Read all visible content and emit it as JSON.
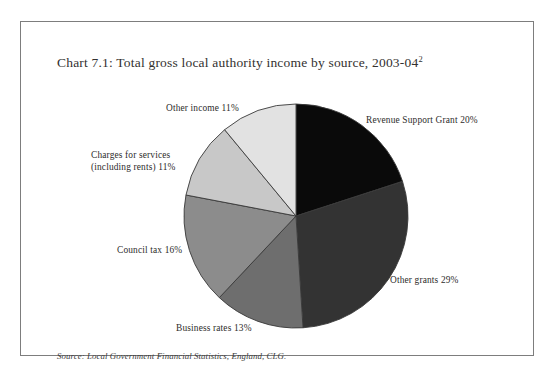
{
  "figure": {
    "title": "Chart 7.1: Total gross local authority income by source, 2003-04",
    "title_superscript": "2",
    "source_note": "Source: Local Government Financial Statistics, England, CLG."
  },
  "labels": {
    "revenue_support_grant": "Revenue Support Grant  20%",
    "other_grants": "Other grants  29%",
    "business_rates": "Business rates  13%",
    "council_tax": "Council tax  16%",
    "charges_for_services_line1": "Charges for services",
    "charges_for_services_line2": "(including rents)  11%",
    "other_income": "Other income  11%"
  },
  "chart_data": {
    "type": "pie",
    "title": "Chart 7.1: Total gross local authority income by source, 2003-04",
    "unit": "percent",
    "start_angle_deg": 0,
    "direction": "clockwise",
    "total": 100,
    "categories": [
      "Revenue Support Grant",
      "Other grants",
      "Business rates",
      "Council tax",
      "Charges for services (including rents)",
      "Other income"
    ],
    "values": [
      20,
      29,
      13,
      16,
      11,
      11
    ],
    "slice_colors": [
      "#0a0a0a",
      "#333333",
      "#6e6e6e",
      "#8c8c8c",
      "#c8c8c8",
      "#e2e2e2"
    ],
    "slice_outline_color": "#3a3a3a",
    "legend": "none",
    "data_labels": "outside",
    "slices": [
      {
        "label": "Revenue Support Grant",
        "value": 20,
        "display": "Revenue Support Grant  20%",
        "color": "#0a0a0a"
      },
      {
        "label": "Other grants",
        "value": 29,
        "display": "Other grants  29%",
        "color": "#333333"
      },
      {
        "label": "Business rates",
        "value": 13,
        "display": "Business rates  13%",
        "color": "#6e6e6e"
      },
      {
        "label": "Council tax",
        "value": 16,
        "display": "Council tax  16%",
        "color": "#8c8c8c"
      },
      {
        "label": "Charges for services (including rents)",
        "value": 11,
        "display": "(including rents)  11%",
        "color": "#c8c8c8"
      },
      {
        "label": "Other income",
        "value": 11,
        "display": "Other income  11%",
        "color": "#e2e2e2"
      }
    ]
  }
}
